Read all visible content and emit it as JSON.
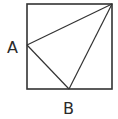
{
  "diagram": {
    "type": "geometry",
    "square": {
      "x": 27,
      "y": 4,
      "size": 85
    },
    "points": {
      "A": {
        "label": "A",
        "x": 27,
        "y": 45
      },
      "B": {
        "label": "B",
        "x": 69,
        "y": 89
      },
      "C": {
        "label": "",
        "x": 112,
        "y": 4
      }
    },
    "labels": {
      "A": "A",
      "B": "B"
    },
    "stroke_color": "#333333"
  }
}
